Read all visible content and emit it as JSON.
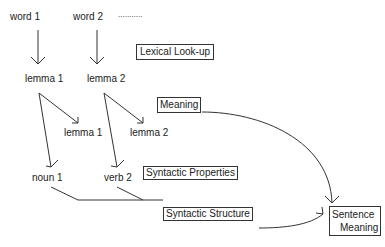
{
  "nodes": {
    "word1": "word 1",
    "word2": "word 2",
    "ellipsis": "...........",
    "lemma1_top": "lemma 1",
    "lemma2_top": "lemma 2",
    "lemma1_sub": "lemma 1",
    "lemma2_sub": "lemma 2",
    "noun1": "noun 1",
    "verb2": "verb 2"
  },
  "stages": {
    "lexical_lookup": "Lexical Look-up",
    "meaning": "Meaning",
    "syntactic_properties": "Syntactic Properties",
    "syntactic_structure": "Syntactic Structure",
    "sentence_meaning_line1": "Sentence",
    "sentence_meaning_line2": "Meaning"
  }
}
